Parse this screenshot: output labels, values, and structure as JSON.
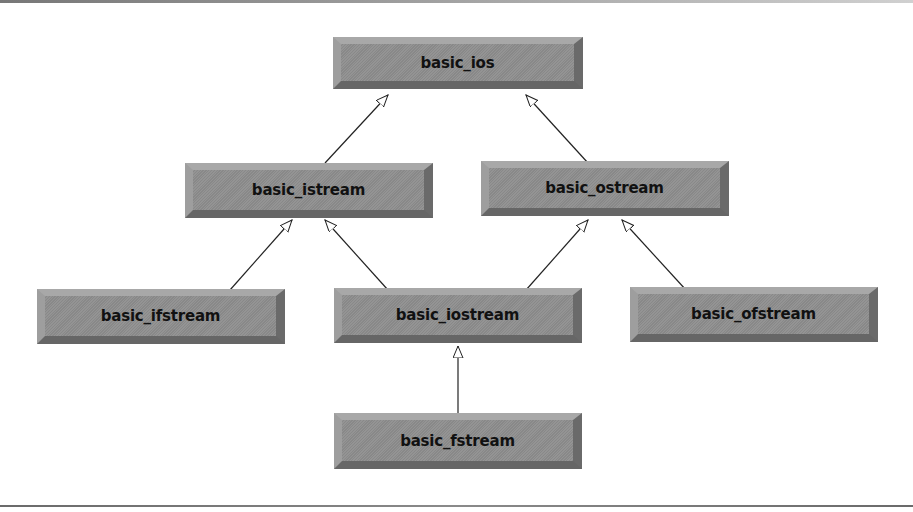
{
  "diagram": {
    "type": "class-inheritance",
    "classes": [
      {
        "id": "basic_ios",
        "label": "basic_ios"
      },
      {
        "id": "basic_istream",
        "label": "basic_istream"
      },
      {
        "id": "basic_ostream",
        "label": "basic_ostream"
      },
      {
        "id": "basic_ifstream",
        "label": "basic_ifstream"
      },
      {
        "id": "basic_iostream",
        "label": "basic_iostream"
      },
      {
        "id": "basic_ofstream",
        "label": "basic_ofstream"
      },
      {
        "id": "basic_fstream",
        "label": "basic_fstream"
      }
    ],
    "inheritance": [
      {
        "from": "basic_istream",
        "to": "basic_ios"
      },
      {
        "from": "basic_ostream",
        "to": "basic_ios"
      },
      {
        "from": "basic_ifstream",
        "to": "basic_istream"
      },
      {
        "from": "basic_iostream",
        "to": "basic_istream"
      },
      {
        "from": "basic_iostream",
        "to": "basic_ostream"
      },
      {
        "from": "basic_ofstream",
        "to": "basic_ostream"
      },
      {
        "from": "basic_fstream",
        "to": "basic_iostream"
      }
    ],
    "arrow_style": "hollow-triangle",
    "colors": {
      "box_face": "#8e8e8e",
      "box_bevel_light": "#a8a8a8",
      "box_bevel_dark": "#666666",
      "label": "#111111",
      "connector": "#222222"
    }
  }
}
